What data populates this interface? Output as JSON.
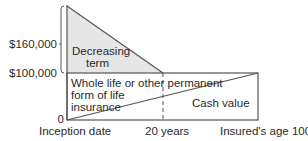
{
  "diagram": {
    "y_axis": {
      "labels": [
        "$160,000",
        "$100,000",
        "0"
      ]
    },
    "x_axis": {
      "labels": [
        "Inception date",
        "20 years",
        "Insured's age 100"
      ]
    },
    "regions": {
      "decreasing_term": {
        "line1": "Decreasing",
        "line2": "term",
        "fill": "#e6e6e6"
      },
      "whole_life": {
        "line1": "Whole life or other permanent",
        "line2": "form of life",
        "line3": "insurance"
      },
      "cash_value": {
        "label": "Cash value"
      }
    },
    "colors": {
      "line": "#555555",
      "text": "#2a2a2a",
      "shade": "#e6e6e6"
    }
  }
}
